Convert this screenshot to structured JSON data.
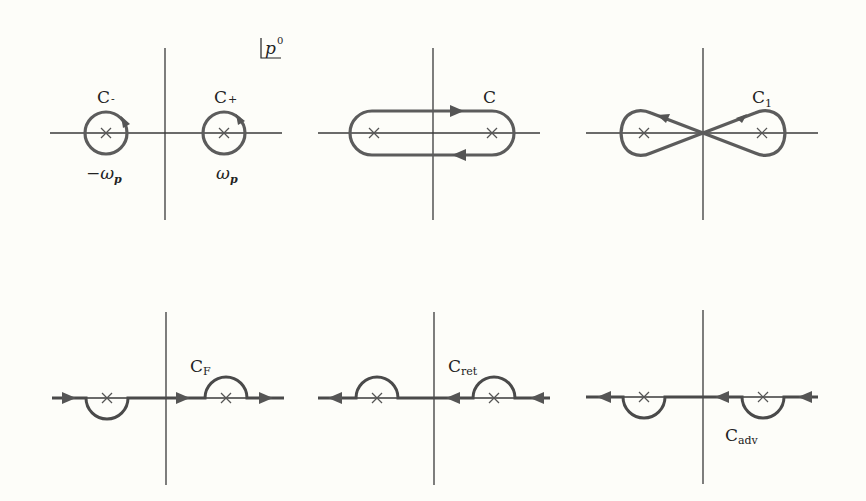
{
  "figure": {
    "variable_label": "p",
    "variable_superscript": "0",
    "panels": [
      {
        "id": "circles",
        "contours": [
          {
            "name": "C",
            "subscript": "-",
            "pole_label": "−ω",
            "pole_label_sub": "p"
          },
          {
            "name": "C",
            "subscript": "+",
            "pole_label": "ω",
            "pole_label_sub": "p"
          }
        ]
      },
      {
        "id": "enclosing",
        "contour": {
          "name": "C",
          "subscript": ""
        }
      },
      {
        "id": "figure-eight",
        "contour": {
          "name": "C",
          "subscript": "1"
        }
      },
      {
        "id": "feynman",
        "contour": {
          "name": "C",
          "subscript": "F"
        }
      },
      {
        "id": "retarded",
        "contour": {
          "name": "C",
          "subscript": "ret"
        }
      },
      {
        "id": "advanced",
        "contour": {
          "name": "C",
          "subscript": "adv"
        }
      }
    ]
  },
  "colors": {
    "background": "#fdfdf9",
    "axis": "#3a3a3a",
    "contour": "#5c5c5c"
  }
}
